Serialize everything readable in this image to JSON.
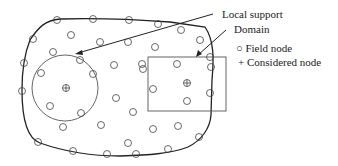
{
  "labels": {
    "local_support": "Local support",
    "domain": "Domain",
    "field_node": "Field node",
    "considered_node": "Considered node"
  },
  "legend": {
    "field_symbol": "○",
    "considered_symbol": "+"
  },
  "colors": {
    "boundary": "#222222",
    "node": "#444444",
    "support": "#555555"
  },
  "nodes": [
    [
      57,
      20
    ],
    [
      93,
      19
    ],
    [
      129,
      20
    ],
    [
      158,
      24
    ],
    [
      181,
      30
    ],
    [
      200,
      40
    ],
    [
      210,
      57
    ],
    [
      33,
      39
    ],
    [
      71,
      35
    ],
    [
      100,
      42
    ],
    [
      128,
      42
    ],
    [
      155,
      47
    ],
    [
      24,
      63
    ],
    [
      53,
      52
    ],
    [
      80,
      60
    ],
    [
      114,
      65
    ],
    [
      142,
      64
    ],
    [
      41,
      73
    ],
    [
      93,
      74
    ],
    [
      143,
      69
    ],
    [
      177,
      64
    ],
    [
      211,
      67
    ],
    [
      22,
      91
    ],
    [
      50,
      106
    ],
    [
      81,
      113
    ],
    [
      116,
      98
    ],
    [
      133,
      112
    ],
    [
      153,
      89
    ],
    [
      187,
      101
    ],
    [
      210,
      93
    ],
    [
      63,
      127
    ],
    [
      101,
      125
    ],
    [
      153,
      129
    ],
    [
      128,
      143
    ],
    [
      178,
      126
    ],
    [
      199,
      137
    ],
    [
      38,
      142
    ],
    [
      73,
      151
    ],
    [
      107,
      154
    ],
    [
      136,
      154
    ],
    [
      168,
      149
    ]
  ]
}
